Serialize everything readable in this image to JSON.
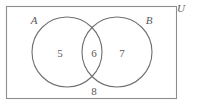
{
  "figure": {
    "type": "venn-diagram",
    "sets": 2,
    "universe": {
      "label": "U",
      "rect": {
        "x": 6,
        "y": 6,
        "width": 171,
        "height": 93
      },
      "label_position": {
        "x": 181,
        "y": 12
      },
      "border_color": "#8d8d8f"
    },
    "circles": [
      {
        "id": "A",
        "label": "A",
        "cx": 67,
        "cy": 52,
        "r": 35,
        "label_position": {
          "x": 34,
          "y": 24
        },
        "stroke_color": "#6f6f71"
      },
      {
        "id": "B",
        "label": "B",
        "cx": 117,
        "cy": 52,
        "r": 35,
        "label_position": {
          "x": 149,
          "y": 24
        },
        "stroke_color": "#6f6f71"
      }
    ],
    "regions": [
      {
        "id": "a-only",
        "description": "A only",
        "value": "5",
        "position": {
          "x": 60,
          "y": 57
        }
      },
      {
        "id": "a-and-b",
        "description": "A intersect B",
        "value": "6",
        "position": {
          "x": 94,
          "y": 57
        }
      },
      {
        "id": "b-only",
        "description": "B only",
        "value": "7",
        "position": {
          "x": 122,
          "y": 57
        }
      },
      {
        "id": "outside",
        "description": "Outside A and B, inside U",
        "value": "8",
        "position": {
          "x": 94,
          "y": 95
        }
      }
    ],
    "text_color": "#58585a",
    "background_color": "#ffffff"
  }
}
